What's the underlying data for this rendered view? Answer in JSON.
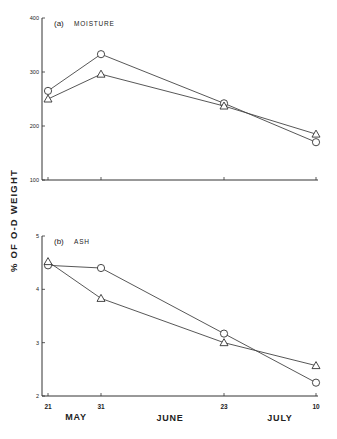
{
  "figure": {
    "ylabel": "% OF O-D WEIGHT",
    "month_labels": [
      "MAY",
      "JUNE",
      "JULY"
    ],
    "x_tick_labels": [
      "21",
      "31",
      "23",
      "10"
    ]
  },
  "chart_data": [
    {
      "type": "line",
      "title": "(a) MOISTURE",
      "panel_label": "(a)",
      "panel_name": "MOISTURE",
      "xlabel": "",
      "ylabel": "% OF O-D WEIGHT",
      "categories": [
        "May 21",
        "May 31",
        "June 23",
        "July 10"
      ],
      "ylim": [
        100,
        400
      ],
      "yticks": [
        100,
        200,
        300,
        400
      ],
      "grid": false,
      "series": [
        {
          "name": "circle",
          "marker": "circle",
          "values": [
            265,
            333,
            242,
            170
          ]
        },
        {
          "name": "triangle",
          "marker": "triangle",
          "values": [
            250,
            296,
            237,
            185
          ]
        }
      ]
    },
    {
      "type": "line",
      "title": "(b) ASH",
      "panel_label": "(b)",
      "panel_name": "ASH",
      "xlabel": "",
      "ylabel": "% OF O-D WEIGHT",
      "categories": [
        "May 21",
        "May 31",
        "June 23",
        "July 10"
      ],
      "x_tick_labels": [
        "21",
        "31",
        "23",
        "10"
      ],
      "month_labels": [
        "MAY",
        "JUNE",
        "JULY"
      ],
      "ylim": [
        2,
        5
      ],
      "yticks": [
        2,
        3,
        4,
        5
      ],
      "grid": false,
      "series": [
        {
          "name": "circle",
          "marker": "circle",
          "values": [
            4.45,
            4.4,
            3.17,
            2.25
          ]
        },
        {
          "name": "triangle",
          "marker": "triangle",
          "values": [
            4.52,
            3.83,
            3.0,
            2.57
          ]
        }
      ]
    }
  ]
}
